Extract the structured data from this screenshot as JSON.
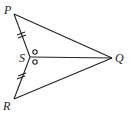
{
  "diagram": {
    "type": "geometry",
    "points": {
      "P": {
        "label": "P",
        "x": 14,
        "y": 14
      },
      "Q": {
        "label": "Q",
        "x": 112,
        "y": 58
      },
      "R": {
        "label": "R",
        "x": 14,
        "y": 99
      },
      "S": {
        "label": "S",
        "x": 30,
        "y": 57
      }
    },
    "segments": [
      "PQ",
      "QR",
      "PS",
      "SR",
      "SQ"
    ],
    "markings": {
      "equal_segments": [
        "PS",
        "SR"
      ],
      "equal_angles": [
        "PSQ",
        "QSR"
      ]
    }
  }
}
